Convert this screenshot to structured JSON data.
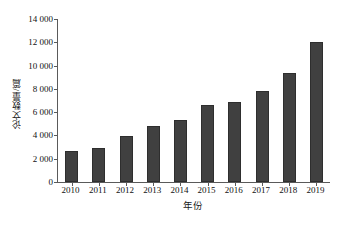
{
  "chart_data": {
    "type": "bar",
    "title": "",
    "subtitle": "",
    "xlabel": "年份",
    "ylabel": "论文数量/篇",
    "categories": [
      "2010",
      "2011",
      "2012",
      "2013",
      "2014",
      "2015",
      "2016",
      "2017",
      "2018",
      "2019"
    ],
    "values": [
      2660,
      2920,
      3950,
      4810,
      5340,
      6630,
      6880,
      7800,
      9350,
      12000
    ],
    "series": [
      {
        "name": "论文数量",
        "values": [
          2660,
          2920,
          3950,
          4810,
          5340,
          6630,
          6880,
          7800,
          9350,
          12000
        ]
      }
    ],
    "ylim": [
      0,
      14000
    ],
    "ytick_values": [
      0,
      2000,
      4000,
      6000,
      8000,
      10000,
      12000,
      14000
    ],
    "ytick_labels": [
      "0",
      "2 000",
      "4 000",
      "6 000",
      "8 000",
      "10 000",
      "12 000",
      "14 000"
    ],
    "xtick_labels": [
      "2010",
      "2011",
      "2012",
      "2013",
      "2014",
      "2015",
      "2016",
      "2017",
      "2018",
      "2019"
    ],
    "grid": false,
    "legend": false,
    "legend_position": "none",
    "bar_color": "#404040",
    "bar_edge_color": "#2e2e2e",
    "axis_color": "#5a5a5a",
    "background_color": "#ffffff",
    "annotations": []
  }
}
